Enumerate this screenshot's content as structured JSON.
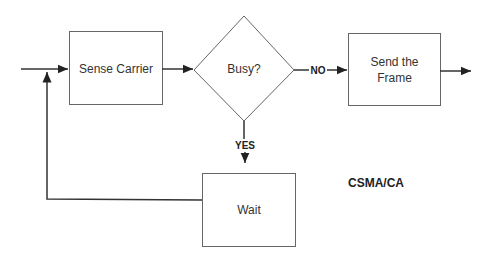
{
  "diagram": {
    "title": "CSMA/CA",
    "nodes": {
      "sense": {
        "label": "Sense Carrier",
        "shape": "rectangle"
      },
      "busy": {
        "label": "Busy?",
        "shape": "diamond"
      },
      "send": {
        "label": "Send the Frame",
        "line1": "Send the",
        "line2": "Frame",
        "shape": "rectangle"
      },
      "wait": {
        "label": "Wait",
        "shape": "rectangle"
      }
    },
    "edges": {
      "no_label": "NO",
      "yes_label": "YES"
    },
    "colors": {
      "stroke": "#555555",
      "text": "#333333"
    }
  }
}
